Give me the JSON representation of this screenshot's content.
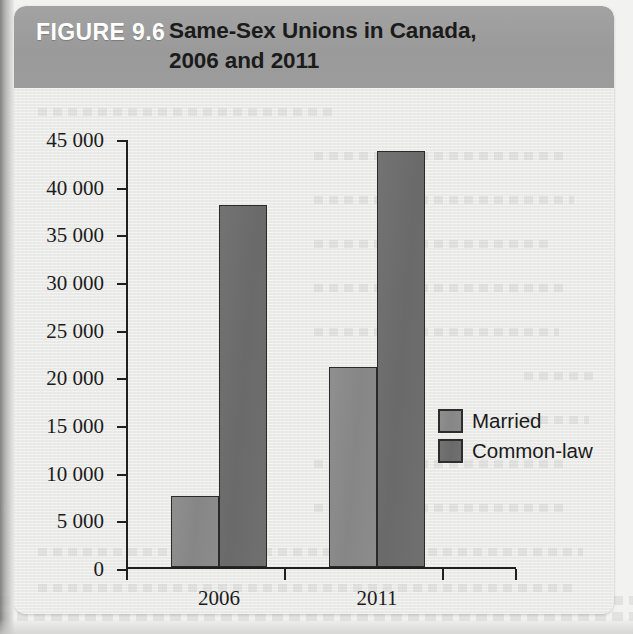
{
  "figure": {
    "number_label": "FIGURE 9.6",
    "title_line1": "Same-Sex Unions in Canada,",
    "title_line2": "2006 and 2011",
    "header_color": "#9a9a9a",
    "header_text_color": "#ffffff",
    "title_text_color": "#1b1b1b",
    "panel_color": "#eaeae8"
  },
  "legend": {
    "position": "right-inside",
    "items": [
      {
        "label": "Married",
        "color": "#8a8a8a"
      },
      {
        "label": "Common-law",
        "color": "#6e6e6e"
      }
    ]
  },
  "chart_data": {
    "type": "bar",
    "title": "Same-Sex Unions in Canada, 2006 and 2011",
    "xlabel": "",
    "ylabel": "",
    "categories": [
      "2006",
      "2011"
    ],
    "series": [
      {
        "name": "Married",
        "color": "#8a8a8a",
        "values": [
          7400,
          21000
        ]
      },
      {
        "name": "Common-law",
        "color": "#6e6e6e",
        "values": [
          38000,
          43600
        ]
      }
    ],
    "ylim": [
      0,
      45000
    ],
    "ytick_step": 5000,
    "ytick_labels": [
      "0",
      "5 000",
      "10 000",
      "15 000",
      "20 000",
      "25 000",
      "30 000",
      "35 000",
      "40 000",
      "45 000"
    ],
    "ytick_values": [
      0,
      5000,
      10000,
      15000,
      20000,
      25000,
      30000,
      35000,
      40000,
      45000
    ],
    "grid": false,
    "legend_position": "right"
  }
}
